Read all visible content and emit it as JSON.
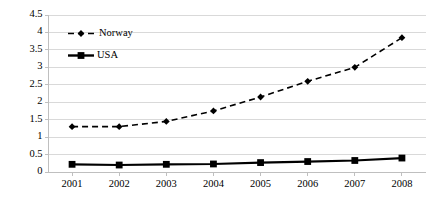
{
  "chart_data": {
    "type": "line",
    "title": "",
    "subtitle": "",
    "xlabel": "",
    "ylabel": "",
    "categories": [
      "2001",
      "2002",
      "2003",
      "2004",
      "2005",
      "2006",
      "2007",
      "2008"
    ],
    "x": [
      2001,
      2002,
      2003,
      2004,
      2005,
      2006,
      2007,
      2008
    ],
    "series": [
      {
        "name": "Norway",
        "values": [
          1.3,
          1.3,
          1.45,
          1.75,
          2.15,
          2.6,
          3.0,
          3.85
        ],
        "line_style": "dashed",
        "marker": "diamond",
        "color": "#000000"
      },
      {
        "name": "USA",
        "values": [
          0.22,
          0.2,
          0.22,
          0.23,
          0.27,
          0.3,
          0.33,
          0.4
        ],
        "line_style": "solid",
        "marker": "square",
        "color": "#000000"
      }
    ],
    "ylim": [
      0,
      4.5
    ],
    "yticks": [
      0,
      0.5,
      1,
      1.5,
      2,
      2.5,
      3,
      3.5,
      4,
      4.5
    ],
    "ytick_labels": [
      "0",
      "0.5",
      "1",
      "1.5",
      "2",
      "2.5",
      "3",
      "3.5",
      "4",
      "4.5"
    ],
    "xtick_labels": [
      "2001",
      "2002",
      "2003",
      "2004",
      "2005",
      "2006",
      "2007",
      "2008"
    ],
    "grid": "horizontal",
    "grid_color": "#d9d9d9",
    "axis_color": "#bfbfbf",
    "legend_position": "upper-left-inside",
    "legend_entries": [
      "Norway",
      "USA"
    ],
    "background": "#ffffff"
  }
}
